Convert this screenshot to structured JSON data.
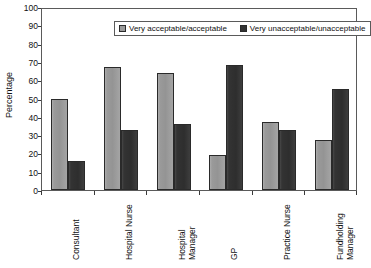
{
  "chart_data": {
    "type": "bar",
    "title": "",
    "xlabel": "",
    "ylabel": "Percentage",
    "ylim": [
      0,
      100
    ],
    "ytick_step": 10,
    "yticks": [
      0,
      10,
      20,
      30,
      40,
      50,
      60,
      70,
      80,
      90,
      100
    ],
    "grid": false,
    "legend_position": "top-center",
    "categories": [
      "Consultant",
      "Hospital Nurse",
      "Hospital Manager",
      "GP",
      "Practice Nurse",
      "Fundholding Manager"
    ],
    "series": [
      {
        "name": "Very acceptable/acceptable",
        "color": "#9a9a9a",
        "values": [
          50,
          67,
          64,
          19,
          37,
          27.5
        ]
      },
      {
        "name": "Very unacceptable/unacceptable",
        "color": "#333333",
        "values": [
          16,
          33,
          36,
          68.5,
          33,
          55
        ]
      }
    ]
  },
  "axes": {
    "y_title": "Percentage"
  },
  "legend": {
    "items": [
      {
        "label": "Very acceptable/acceptable"
      },
      {
        "label": "Very unacceptable/unacceptable"
      }
    ]
  }
}
